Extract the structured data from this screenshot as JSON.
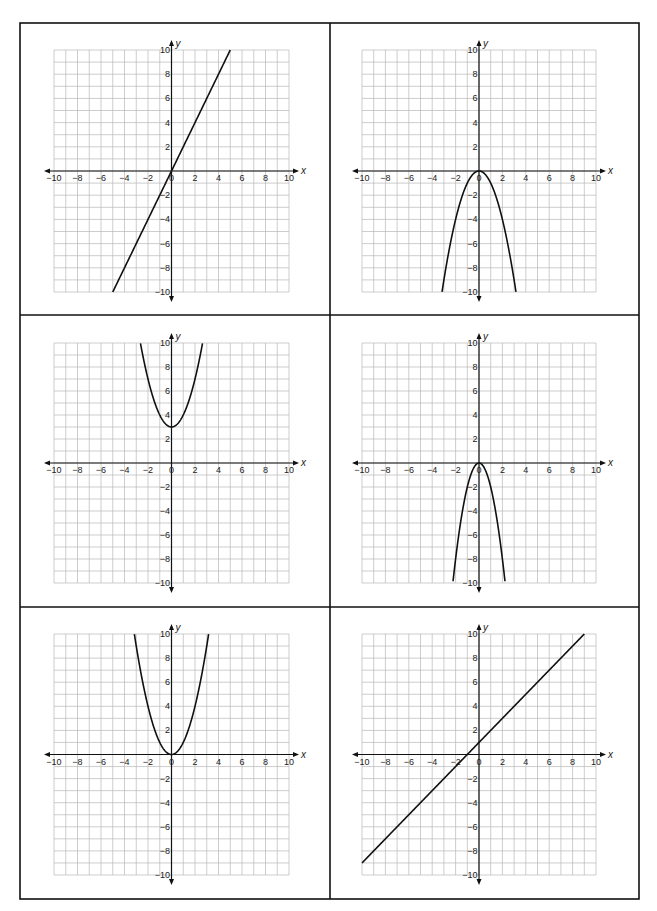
{
  "worksheet": {
    "layout": {
      "rows": 3,
      "columns": 2
    },
    "colors": {
      "grid": "#b8b8b8",
      "axis": "#111111",
      "curve": "#111111",
      "border": "#111111"
    }
  },
  "chart_data": [
    {
      "type": "line",
      "position": "row1-col1",
      "title": "",
      "xlabel": "x",
      "ylabel": "y",
      "xlim": [
        -10,
        10
      ],
      "ylim": [
        -10,
        10
      ],
      "grid": true,
      "x_tick_labels": [
        "−10",
        "−8",
        "−6",
        "−4",
        "−2",
        "0",
        "2",
        "4",
        "6",
        "8",
        "10"
      ],
      "y_tick_labels": [
        "10",
        "8",
        "6",
        "4",
        "2",
        "−2",
        "−4",
        "−6",
        "−8",
        "−10"
      ],
      "function": "y = 2x",
      "kind": "linear",
      "a": 0,
      "slope": 2,
      "intercept": 0,
      "x": [
        -5,
        0,
        5
      ],
      "y": [
        -10,
        0,
        10
      ]
    },
    {
      "type": "line",
      "position": "row1-col2",
      "title": "",
      "xlabel": "x",
      "ylabel": "y",
      "xlim": [
        -10,
        10
      ],
      "ylim": [
        -10,
        10
      ],
      "grid": true,
      "x_tick_labels": [
        "−10",
        "−8",
        "−6",
        "−4",
        "−2",
        "0",
        "2",
        "4",
        "6",
        "8",
        "10"
      ],
      "y_tick_labels": [
        "10",
        "8",
        "6",
        "4",
        "2",
        "−2",
        "−4",
        "−6",
        "−8",
        "−10"
      ],
      "function": "y = −x²",
      "kind": "quadratic",
      "a": -1,
      "slope": 0,
      "intercept": 0,
      "x": [
        -3.16,
        -2,
        -1,
        0,
        1,
        2,
        3.16
      ],
      "y": [
        -10,
        -4,
        -1,
        0,
        -1,
        -4,
        -10
      ]
    },
    {
      "type": "line",
      "position": "row2-col1",
      "title": "",
      "xlabel": "x",
      "ylabel": "y",
      "xlim": [
        -10,
        10
      ],
      "ylim": [
        -10,
        10
      ],
      "grid": true,
      "x_tick_labels": [
        "−10",
        "−8",
        "−6",
        "−4",
        "−2",
        "0",
        "2",
        "4",
        "6",
        "8",
        "10"
      ],
      "y_tick_labels": [
        "10",
        "8",
        "6",
        "4",
        "2",
        "−2",
        "−4",
        "−6",
        "−8",
        "−10"
      ],
      "function": "y = x² + 3",
      "kind": "quadratic",
      "a": 1,
      "slope": 0,
      "intercept": 3,
      "x": [
        -2.65,
        -2,
        -1,
        0,
        1,
        2,
        2.65
      ],
      "y": [
        10,
        7,
        4,
        3,
        4,
        7,
        10
      ]
    },
    {
      "type": "line",
      "position": "row2-col2",
      "title": "",
      "xlabel": "x",
      "ylabel": "y",
      "xlim": [
        -10,
        10
      ],
      "ylim": [
        -10,
        10
      ],
      "grid": true,
      "x_tick_labels": [
        "−10",
        "−8",
        "−6",
        "−4",
        "−2",
        "0",
        "2",
        "4",
        "6",
        "8",
        "10"
      ],
      "y_tick_labels": [
        "10",
        "8",
        "6",
        "4",
        "2",
        "−2",
        "−4",
        "−6",
        "−8",
        "−10"
      ],
      "function": "y = −2x²",
      "kind": "quadratic",
      "a": -2,
      "slope": 0,
      "intercept": 0,
      "x": [
        -2.24,
        -2,
        -1,
        0,
        1,
        2,
        2.24
      ],
      "y": [
        -10,
        -8,
        -2,
        0,
        -2,
        -8,
        -10
      ]
    },
    {
      "type": "line",
      "position": "row3-col1",
      "title": "",
      "xlabel": "x",
      "ylabel": "y",
      "xlim": [
        -10,
        10
      ],
      "ylim": [
        -10,
        10
      ],
      "grid": true,
      "x_tick_labels": [
        "−10",
        "−8",
        "−6",
        "−4",
        "−2",
        "0",
        "2",
        "4",
        "6",
        "8",
        "10"
      ],
      "y_tick_labels": [
        "10",
        "8",
        "6",
        "4",
        "2",
        "−2",
        "−4",
        "−6",
        "−8",
        "−10"
      ],
      "function": "y = x²",
      "kind": "quadratic",
      "a": 1,
      "slope": 0,
      "intercept": 0,
      "x": [
        -3.16,
        -2,
        -1,
        0,
        1,
        2,
        3.16
      ],
      "y": [
        10,
        4,
        1,
        0,
        1,
        4,
        10
      ]
    },
    {
      "type": "line",
      "position": "row3-col2",
      "title": "",
      "xlabel": "x",
      "ylabel": "y",
      "xlim": [
        -10,
        10
      ],
      "ylim": [
        -10,
        10
      ],
      "grid": true,
      "x_tick_labels": [
        "−10",
        "−8",
        "−6",
        "−4",
        "−2",
        "0",
        "2",
        "4",
        "6",
        "8",
        "10"
      ],
      "y_tick_labels": [
        "10",
        "8",
        "6",
        "4",
        "2",
        "−2",
        "−4",
        "−6",
        "−8",
        "−10"
      ],
      "function": "y = x + 1",
      "kind": "linear",
      "a": 0,
      "slope": 1,
      "intercept": 1,
      "x": [
        -10,
        -1,
        0,
        9
      ],
      "y": [
        -9,
        0,
        1,
        10
      ]
    }
  ]
}
